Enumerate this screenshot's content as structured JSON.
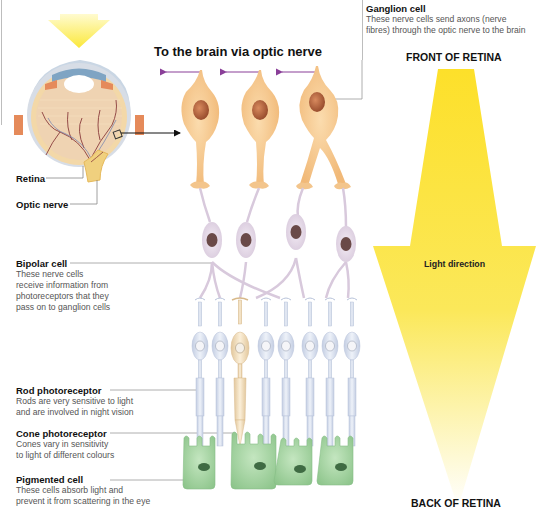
{
  "diagram": {
    "heading": "To the brain via optic nerve",
    "front_label": "FRONT OF RETINA",
    "back_label": "BACK OF RETINA",
    "light_direction_label": "Light direction",
    "eye": {
      "retina_label": "Retina",
      "optic_nerve_label": "Optic nerve"
    },
    "labels": [
      {
        "id": "ganglion",
        "title": "Ganglion cell",
        "desc": [
          "These nerve cells send axons (nerve",
          "fibres) through the optic nerve to the brain"
        ]
      },
      {
        "id": "bipolar",
        "title": "Bipolar cell",
        "desc": [
          "These nerve cells",
          "receive information from",
          "photoreceptors that they",
          "pass on to ganglion cells"
        ]
      },
      {
        "id": "rod",
        "title": "Rod photoreceptor",
        "desc": [
          "Rods are very sensitive to light",
          "and are involved in night vision"
        ]
      },
      {
        "id": "cone",
        "title": "Cone photoreceptor",
        "desc": [
          "Cones vary in sensitivity",
          "to light of different colours"
        ]
      },
      {
        "id": "pigmented",
        "title": "Pigmented cell",
        "desc": [
          "These cells absorb light and",
          "prevent it from scattering in the eye"
        ]
      }
    ],
    "colors": {
      "light_arrow": "#fbe43a",
      "ganglion_cell": "#f6c98f",
      "ganglion_nucleus": "#b8643e",
      "bipolar_cell": "#e6dbe8",
      "bipolar_nucleus": "#6a4a48",
      "rod_cell": "#d9e1ef",
      "cone_cell": "#efdcbc",
      "pigmented_cell": "#a9d6a6",
      "axon_arrow": "#8a3f98"
    },
    "counts": {
      "ganglion_cells": 3,
      "bipolar_cells": 4,
      "rods": 7,
      "cones": 1,
      "pigmented_cells": 4
    }
  }
}
